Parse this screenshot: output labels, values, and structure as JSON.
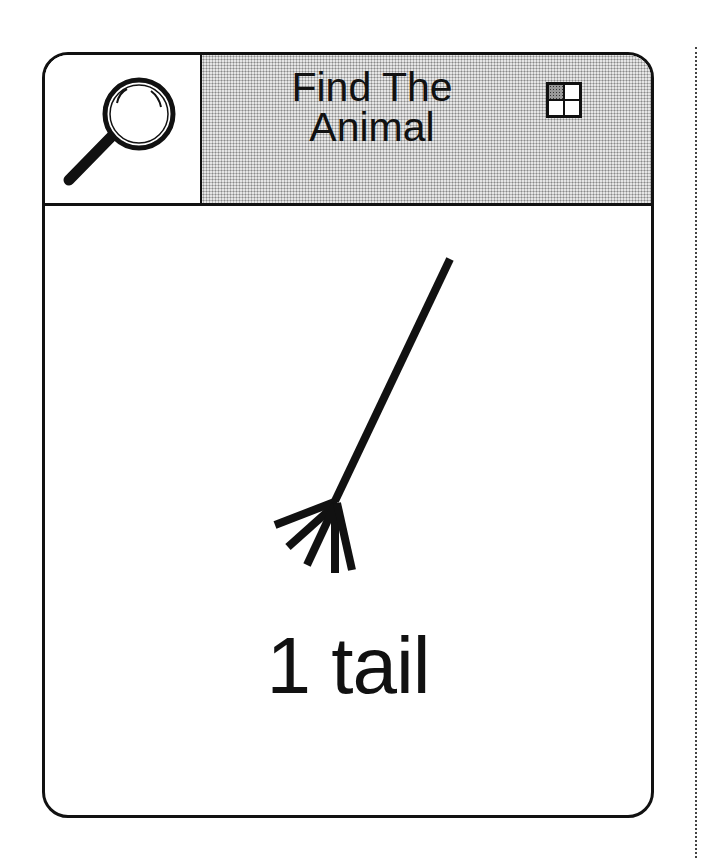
{
  "card": {
    "title": "Find The Animal",
    "title_line1": "Find The",
    "title_line2": "Animal",
    "clue": "1 tail",
    "icons": {
      "left": "magnifying-glass-icon",
      "right": "grid-quadrant-icon"
    }
  }
}
